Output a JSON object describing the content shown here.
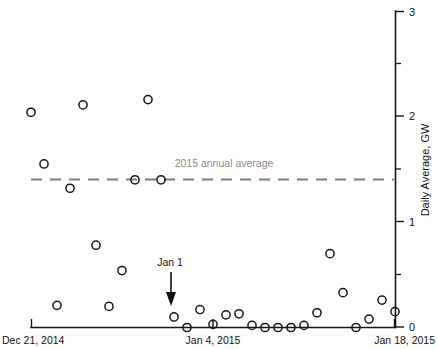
{
  "chart_data": {
    "type": "scatter",
    "title": "",
    "xlabel": "",
    "ylabel": "Daily Average, GW",
    "xlim": [
      "Dec 21, 2014",
      "Jan 18, 2015"
    ],
    "ylim": [
      0,
      3
    ],
    "grid": false,
    "legend": "none",
    "y_ticks": [
      0,
      1,
      2,
      3
    ],
    "y_tick_labels": [
      "0",
      "1",
      "2",
      "3"
    ],
    "y_minor_ticks": [
      0.5,
      1.5,
      2.5
    ],
    "y_axis_position": "right",
    "x_ticks": [
      "Dec 21, 2014",
      "Jan 4, 2015",
      "Jan 18, 2015"
    ],
    "x_tick_labels": [
      "Dec 21, 2014",
      "Jan 4, 2015",
      "Jan 18, 2015"
    ],
    "x_tick_days": [
      0,
      14,
      28
    ],
    "marker": "open-circle",
    "series": [
      {
        "name": "Daily Average",
        "x_days": [
          0,
          1,
          2,
          3,
          4,
          5,
          6,
          7,
          8,
          9,
          10,
          11,
          12,
          13,
          14,
          15,
          16,
          17,
          18,
          19,
          20,
          21,
          22,
          23,
          24,
          25,
          26,
          27,
          28
        ],
        "x_labels": [
          "Dec 21, 2014",
          "Dec 22, 2014",
          "Dec 23, 2014",
          "Dec 24, 2014",
          "Dec 25, 2014",
          "Dec 26, 2014",
          "Dec 27, 2014",
          "Dec 28, 2014",
          "Dec 29, 2014",
          "Dec 30, 2014",
          "Dec 31, 2014",
          "Jan 1, 2015",
          "Jan 2, 2015",
          "Jan 3, 2015",
          "Jan 4, 2015",
          "Jan 5, 2015",
          "Jan 6, 2015",
          "Jan 7, 2015",
          "Jan 8, 2015",
          "Jan 9, 2015",
          "Jan 10, 2015",
          "Jan 11, 2015",
          "Jan 12, 2015",
          "Jan 13, 2015",
          "Jan 14, 2015",
          "Jan 15, 2015",
          "Jan 16, 2015",
          "Jan 17, 2015",
          "Jan 18, 2015"
        ],
        "values": [
          2.04,
          1.55,
          0.21,
          1.32,
          2.11,
          0.78,
          0.2,
          0.54,
          1.4,
          2.16,
          1.4,
          0.1,
          0.0,
          0.17,
          0.03,
          0.12,
          0.13,
          0.02,
          0.0,
          0.0,
          0.0,
          0.02,
          0.14,
          0.7,
          0.33,
          0.0,
          0.08,
          0.26,
          0.15
        ]
      }
    ],
    "annotations": [
      {
        "id": "annual-average",
        "text": "2015 annual average",
        "type": "horizontal-dashed-line",
        "value": 1.42,
        "color": "#7d7d7d",
        "label_x_day": 12.5
      },
      {
        "id": "jan-1-arrow",
        "text": "Jan 1",
        "type": "arrow",
        "points_to_x_day": 11,
        "points_to_y": 0.22,
        "color": "#111111"
      }
    ]
  }
}
